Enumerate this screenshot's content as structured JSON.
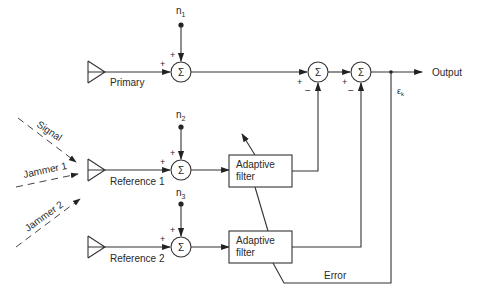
{
  "diagram": {
    "type": "adaptive noise cancelling block diagram",
    "nodes": {
      "primary_label": "Primary",
      "reference1_label": "Reference 1",
      "reference2_label": "Reference 2",
      "filter1_line1": "Adaptive",
      "filter1_line2": "filter",
      "filter2_line1": "Adaptive",
      "filter2_line2": "filter",
      "sum_symbol": "Σ",
      "output_label": "Output",
      "error_label": "Error",
      "error_symbol": "ε",
      "error_subscript": "k"
    },
    "noise_inputs": [
      {
        "name": "n",
        "sub": "1"
      },
      {
        "name": "n",
        "sub": "2"
      },
      {
        "name": "n",
        "sub": "3"
      }
    ],
    "incoming_waves": [
      {
        "label": "Signal"
      },
      {
        "label": "Jammer 1"
      },
      {
        "label": "Jammer 2"
      }
    ],
    "signs": {
      "plus": "+",
      "minus": "−"
    }
  }
}
